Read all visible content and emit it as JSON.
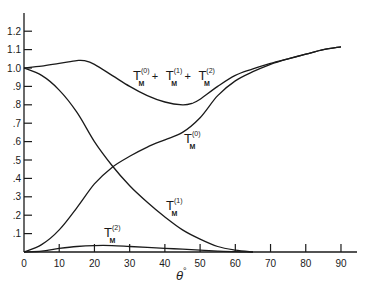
{
  "chart_data": {
    "type": "line",
    "title": "",
    "xlabel": "θ°",
    "ylabel": "",
    "xlim": [
      0,
      95
    ],
    "ylim": [
      0,
      1.28
    ],
    "grid": false,
    "legend": "inline curve labels",
    "x_ticks": [
      0,
      10,
      20,
      30,
      40,
      50,
      60,
      70,
      80,
      90
    ],
    "x_tick_labels": [
      "0",
      "10",
      "20",
      "30",
      "40",
      "50",
      "60",
      "70",
      "80",
      "90"
    ],
    "y_ticks": [
      0.1,
      0.2,
      0.3,
      0.4,
      0.5,
      0.6,
      0.7,
      0.8,
      0.9,
      1.0,
      1.1,
      1.2
    ],
    "y_tick_labels": [
      ".1",
      ".2",
      ".3",
      ".4",
      ".5",
      ".6",
      ".7",
      ".8",
      ".9",
      "1.0",
      "1.1",
      "1.2"
    ],
    "series": [
      {
        "name": "T_M^(0) + T_M^(1) + T_M^(2)",
        "x": [
          0,
          5,
          10,
          15,
          17,
          20,
          25,
          30,
          35,
          40,
          45,
          48,
          50,
          55,
          60,
          65,
          70,
          75,
          80,
          85,
          90
        ],
        "values": [
          1.0,
          1.01,
          1.025,
          1.04,
          1.04,
          1.02,
          0.96,
          0.9,
          0.85,
          0.815,
          0.8,
          0.81,
          0.83,
          0.9,
          0.96,
          0.995,
          1.025,
          1.05,
          1.075,
          1.1,
          1.115
        ]
      },
      {
        "name": "T_M^(0)",
        "x": [
          0,
          5,
          10,
          15,
          20,
          25,
          30,
          35,
          40,
          45,
          50,
          55,
          60,
          65,
          70,
          75,
          80,
          85,
          90
        ],
        "values": [
          0.0,
          0.04,
          0.12,
          0.24,
          0.37,
          0.46,
          0.52,
          0.57,
          0.61,
          0.65,
          0.73,
          0.85,
          0.93,
          0.98,
          1.02,
          1.05,
          1.075,
          1.1,
          1.115
        ]
      },
      {
        "name": "T_M^(1)",
        "x": [
          0,
          5,
          10,
          15,
          20,
          25,
          30,
          35,
          40,
          45,
          50,
          55,
          60,
          65
        ],
        "values": [
          1.0,
          0.96,
          0.88,
          0.76,
          0.6,
          0.47,
          0.36,
          0.27,
          0.19,
          0.12,
          0.07,
          0.03,
          0.01,
          0.0
        ]
      },
      {
        "name": "T_M^(2)",
        "x": [
          0,
          5,
          10,
          15,
          20,
          25,
          30,
          35,
          40,
          45,
          50,
          55,
          60,
          65
        ],
        "values": [
          0.0,
          0.005,
          0.02,
          0.03,
          0.035,
          0.035,
          0.03,
          0.025,
          0.02,
          0.015,
          0.01,
          0.005,
          0.002,
          0.0
        ]
      }
    ],
    "annotations": [
      {
        "text": "T_M^(0) + T_M^(1) + T_M^(2)",
        "x": 31,
        "y": 0.92
      },
      {
        "text": "T_M^(0)",
        "x": 55,
        "y": 0.62
      },
      {
        "text": "T_M^(1)",
        "x": 39,
        "y": 0.27
      },
      {
        "text": "T_M^(2)",
        "x": 21,
        "y": 0.07
      }
    ]
  },
  "labels": {
    "sum": {
      "base": "T",
      "sub": "M",
      "sup0": "(0)",
      "sup1": "(1)",
      "sup2": "(2)",
      "plus": "+"
    },
    "t0": {
      "base": "T",
      "sub": "M",
      "sup": "(0)"
    },
    "t1": {
      "base": "T",
      "sub": "M",
      "sup": "(1)"
    },
    "t2": {
      "base": "T",
      "sub": "M",
      "sup": "(2)"
    },
    "xaxis": {
      "theta": "θ",
      "deg": "°"
    }
  }
}
